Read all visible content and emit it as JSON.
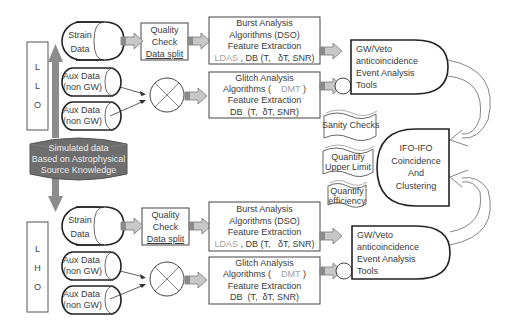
{
  "colors": {
    "stroke": "#2a2a2a",
    "arrow_fill": "#c8c8c8",
    "sim_fill": "#6e6e6e",
    "sim_text": "#e6e6e6",
    "muted_text": "#a0a0a0"
  },
  "simulated": {
    "line1": "Simulated data",
    "line2": "Based on Astrophysical",
    "line3": "Source Knowledge"
  },
  "sites": [
    {
      "id": "llo",
      "label_chars": [
        "L",
        "L",
        "O"
      ],
      "strain": {
        "line1": "Strain",
        "line2": "Data"
      },
      "aux": [
        {
          "line1": "Aux Data",
          "line2": "(non GW)"
        },
        {
          "line1": "Aux Data",
          "line2": "(non GW)"
        }
      ],
      "quality": {
        "line1": "Quality",
        "line2": "Check",
        "line3": "Data split"
      },
      "burst": {
        "line1": "Burst Analysis",
        "line2": "Algorithms (DSO)",
        "line3": "Feature Extraction",
        "line4_muted": "LDAS",
        "line4_rest": " , DB (T,   δT, SNR)"
      },
      "glitch": {
        "line1": "Glitch Analysis",
        "line2_pre": "Algorithms (",
        "line2_muted": "DMT",
        "line2_post": ")",
        "line3": "Feature Extraction",
        "line4": "DB  (T,  δT, SNR)"
      },
      "event": {
        "line1": "GW/Veto",
        "line2": "anticoincidence",
        "line3": "Event Analysis",
        "line4": "Tools"
      }
    },
    {
      "id": "lho",
      "label_chars": [
        "L",
        "H",
        "O"
      ],
      "strain": {
        "line1": "Strain",
        "line2": "Data"
      },
      "aux": [
        {
          "line1": "Aux Data",
          "line2": "(non GW)"
        },
        {
          "line1": "Aux Data",
          "line2": "(non GW)"
        }
      ],
      "quality": {
        "line1": "Quality",
        "line2": "Check",
        "line3": "Data split"
      },
      "burst": {
        "line1": "Burst Analysis",
        "line2": "Algorithms (DSO)",
        "line3": "Feature Extraction",
        "line4_muted": "LDAS",
        "line4_rest": " , DB (T,   δT, SNR)"
      },
      "glitch": {
        "line1": "Glitch Analysis",
        "line2_pre": "Algorithms (",
        "line2_muted": "DMT",
        "line2_post": ")",
        "line3": "Feature Extraction",
        "line4": "DB  (T,  δT, SNR)"
      },
      "event": {
        "line1": "GW/Veto",
        "line2": "anticoincidence",
        "line3": "Event Analysis",
        "line4": "Tools"
      }
    }
  ],
  "documents": [
    {
      "line1": "Sanity Checks"
    },
    {
      "line1": "Quantify",
      "line2": "Upper Limit"
    },
    {
      "line1": "Quantify",
      "line2": "efficiency"
    }
  ],
  "ifo": {
    "line1": "IFO-IFO",
    "line2": "Coincidence",
    "line3": "And",
    "line4": "Clustering"
  }
}
